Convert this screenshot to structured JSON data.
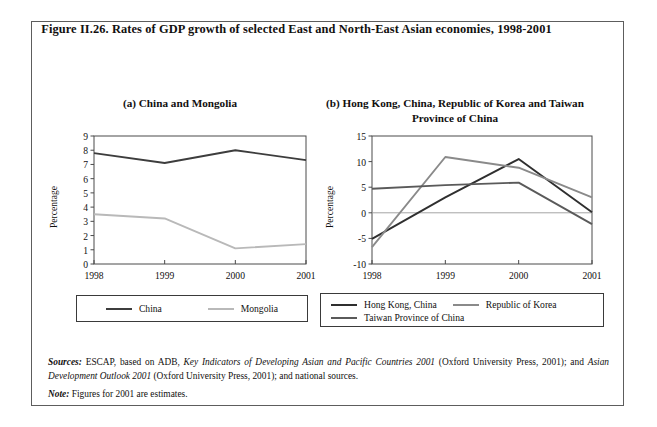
{
  "figure": {
    "title": "Figure II.26.  Rates of GDP growth of selected East and North-East Asian economies, 1998-2001",
    "panel_a_title": "(a)   China and Mongolia",
    "panel_b_title": "(b)   Hong Kong, China, Republic of Korea and Taiwan Province of China"
  },
  "footnotes": {
    "sources_label": "Sources:",
    "sources_text_1": "ESCAP, based on ADB, ",
    "sources_italic_1": "Key Indicators of Developing Asian and Pacific Countries 2001",
    "sources_text_2": " (Oxford University Press, 2001); and ",
    "sources_italic_2": "Asian Development Outlook 2001",
    "sources_text_3": " (Oxford University Press, 2001);   and national sources.",
    "note_label": "Note:",
    "note_text": "Figures for 2001 are estimates."
  },
  "colors": {
    "china": "#3d3d3d",
    "mongolia": "#b9b9b9",
    "hong_kong": "#2f2f2f",
    "korea": "#8a8a8a",
    "taiwan": "#5a5a5a",
    "axis": "#4a4a4a",
    "frame": "#5d5d5d"
  },
  "chart_data": [
    {
      "type": "line",
      "title": "(a)   China and Mongolia",
      "xlabel": "",
      "ylabel": "Percentage",
      "categories": [
        "1998",
        "1999",
        "2000",
        "2001"
      ],
      "x": [
        1998,
        1999,
        2000,
        2001
      ],
      "ylim": [
        0,
        9
      ],
      "yticks": [
        0,
        1,
        2,
        3,
        4,
        5,
        6,
        7,
        8,
        9
      ],
      "grid": false,
      "legend_position": "bottom",
      "series": [
        {
          "name": "China",
          "values": [
            7.8,
            7.1,
            8.0,
            7.3
          ],
          "color": "#3d3d3d"
        },
        {
          "name": "Mongolia",
          "values": [
            3.5,
            3.2,
            1.1,
            1.4
          ],
          "color": "#b9b9b9"
        }
      ]
    },
    {
      "type": "line",
      "title": "(b)   Hong Kong, China, Republic of Korea and Taiwan Province of China",
      "xlabel": "",
      "ylabel": "Percentage",
      "categories": [
        "1998",
        "1999",
        "2000",
        "2001"
      ],
      "x": [
        1998,
        1999,
        2000,
        2001
      ],
      "ylim": [
        -10,
        15
      ],
      "yticks": [
        -10,
        -5,
        0,
        5,
        10,
        15
      ],
      "grid": false,
      "legend_position": "bottom",
      "series": [
        {
          "name": "Hong Kong, China",
          "values": [
            -5.1,
            3.0,
            10.5,
            0.1
          ],
          "color": "#2f2f2f"
        },
        {
          "name": "Republic of Korea",
          "values": [
            -6.7,
            10.9,
            8.8,
            3.0
          ],
          "color": "#8a8a8a"
        },
        {
          "name": "Taiwan Province of China",
          "values": [
            4.7,
            5.4,
            5.9,
            -2.2
          ],
          "color": "#5a5a5a"
        }
      ]
    }
  ]
}
